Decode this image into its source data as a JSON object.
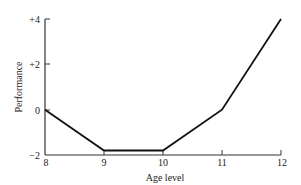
{
  "chart_data": {
    "type": "line",
    "title": "",
    "xlabel": "Age level",
    "ylabel": "Performance",
    "x": [
      8,
      9,
      10,
      11,
      12
    ],
    "series": [
      {
        "name": "Performance",
        "values": [
          0,
          -1.8,
          -1.8,
          0,
          4
        ]
      }
    ],
    "xticks": [
      "8",
      "9",
      "10",
      "11",
      "12"
    ],
    "yticks": [
      "+4",
      "+2",
      "0",
      "−2"
    ],
    "xlim": [
      8,
      12
    ],
    "ylim": [
      -2,
      4
    ],
    "grid": false,
    "legend": null
  },
  "labels": {
    "xlabel": "Age level",
    "ylabel": "Performance",
    "xticks": [
      "8",
      "9",
      "10",
      "11",
      "12"
    ],
    "yticks": [
      "+4",
      "+2",
      "0",
      "−2"
    ]
  },
  "colors": {
    "line": "#111111",
    "axis": "#333333"
  }
}
